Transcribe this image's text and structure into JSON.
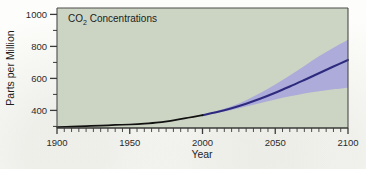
{
  "figure": {
    "panel_title": "CO",
    "panel_title_sub": "2",
    "panel_title_rest": " Concentrations",
    "panel_bg_color": "#ccd5c3",
    "page_bg_color": "#fdfdfb"
  },
  "chart_data": {
    "type": "line",
    "title": "CO2 Concentrations",
    "xlabel": "Year",
    "ylabel": "Parts per Million",
    "xlim": [
      1900,
      2100
    ],
    "ylim": [
      290,
      1040
    ],
    "grid": false,
    "legend": "none",
    "x_ticks_major": [
      1900,
      1950,
      2000,
      2050,
      2100
    ],
    "x_tick_labels": [
      "1900",
      "1950",
      "2000",
      "2050",
      "2100"
    ],
    "x_minor_step": 5,
    "y_ticks_major": [
      400,
      600,
      800,
      1000
    ],
    "y_tick_labels": [
      "400",
      "600",
      "800",
      "1000"
    ],
    "y_minor_step": 100,
    "series": [
      {
        "name": "Observed CO2 concentration",
        "color": "#111111",
        "x": [
          1900,
          1910,
          1920,
          1930,
          1940,
          1950,
          1960,
          1970,
          1980,
          1990,
          2000
        ],
        "values": [
          296,
          299,
          302,
          305,
          309,
          312,
          317,
          325,
          338,
          354,
          370
        ]
      },
      {
        "name": "Projected CO2 concentration",
        "color": "#2e2b7f",
        "x": [
          2000,
          2010,
          2020,
          2030,
          2040,
          2050,
          2060,
          2070,
          2080,
          2090,
          2100
        ],
        "values": [
          370,
          390,
          414,
          442,
          474,
          510,
          549,
          590,
          632,
          674,
          715
        ]
      }
    ],
    "uncertainty_band": {
      "name": "Projection range",
      "color": "#a6a3dd",
      "x": [
        2000,
        2010,
        2020,
        2030,
        2040,
        2050,
        2060,
        2070,
        2080,
        2090,
        2100
      ],
      "upper": [
        372,
        396,
        426,
        464,
        510,
        562,
        618,
        678,
        738,
        792,
        842
      ],
      "lower": [
        368,
        384,
        402,
        424,
        446,
        468,
        488,
        506,
        520,
        532,
        542
      ]
    },
    "annotations": []
  }
}
